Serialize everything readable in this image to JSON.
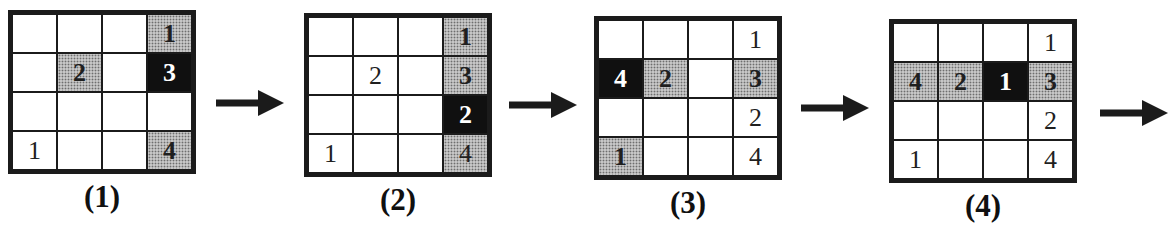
{
  "grids": [
    {
      "label": "(1)",
      "rows": [
        [
          {
            "v": "",
            "s": "empty"
          },
          {
            "v": "",
            "s": "empty"
          },
          {
            "v": "",
            "s": "empty"
          },
          {
            "v": "1",
            "s": "shaded"
          }
        ],
        [
          {
            "v": "",
            "s": "empty"
          },
          {
            "v": "2",
            "s": "shaded"
          },
          {
            "v": "",
            "s": "empty"
          },
          {
            "v": "3",
            "s": "solid"
          }
        ],
        [
          {
            "v": "",
            "s": "empty"
          },
          {
            "v": "",
            "s": "empty"
          },
          {
            "v": "",
            "s": "empty"
          },
          {
            "v": "",
            "s": "empty"
          }
        ],
        [
          {
            "v": "1",
            "s": "plain"
          },
          {
            "v": "",
            "s": "empty"
          },
          {
            "v": "",
            "s": "empty"
          },
          {
            "v": "4",
            "s": "shaded"
          }
        ]
      ]
    },
    {
      "label": "(2)",
      "rows": [
        [
          {
            "v": "",
            "s": "empty"
          },
          {
            "v": "",
            "s": "empty"
          },
          {
            "v": "",
            "s": "empty"
          },
          {
            "v": "1",
            "s": "shaded"
          }
        ],
        [
          {
            "v": "",
            "s": "empty"
          },
          {
            "v": "2",
            "s": "plain"
          },
          {
            "v": "",
            "s": "empty"
          },
          {
            "v": "3",
            "s": "shaded"
          }
        ],
        [
          {
            "v": "",
            "s": "empty"
          },
          {
            "v": "",
            "s": "empty"
          },
          {
            "v": "",
            "s": "empty"
          },
          {
            "v": "2",
            "s": "solid"
          }
        ],
        [
          {
            "v": "1",
            "s": "plain"
          },
          {
            "v": "",
            "s": "empty"
          },
          {
            "v": "",
            "s": "empty"
          },
          {
            "v": "4",
            "s": "shaded-plain"
          }
        ]
      ]
    },
    {
      "label": "(3)",
      "rows": [
        [
          {
            "v": "",
            "s": "empty"
          },
          {
            "v": "",
            "s": "empty"
          },
          {
            "v": "",
            "s": "empty"
          },
          {
            "v": "1",
            "s": "plain"
          }
        ],
        [
          {
            "v": "4",
            "s": "solid"
          },
          {
            "v": "2",
            "s": "shaded"
          },
          {
            "v": "",
            "s": "empty"
          },
          {
            "v": "3",
            "s": "shaded"
          }
        ],
        [
          {
            "v": "",
            "s": "empty"
          },
          {
            "v": "",
            "s": "empty"
          },
          {
            "v": "",
            "s": "empty"
          },
          {
            "v": "2",
            "s": "plain"
          }
        ],
        [
          {
            "v": "1",
            "s": "shaded"
          },
          {
            "v": "",
            "s": "empty"
          },
          {
            "v": "",
            "s": "empty"
          },
          {
            "v": "4",
            "s": "plain"
          }
        ]
      ]
    },
    {
      "label": "(4)",
      "rows": [
        [
          {
            "v": "",
            "s": "empty"
          },
          {
            "v": "",
            "s": "empty"
          },
          {
            "v": "",
            "s": "empty"
          },
          {
            "v": "1",
            "s": "plain"
          }
        ],
        [
          {
            "v": "4",
            "s": "shaded"
          },
          {
            "v": "2",
            "s": "shaded"
          },
          {
            "v": "1",
            "s": "solid"
          },
          {
            "v": "3",
            "s": "shaded"
          }
        ],
        [
          {
            "v": "",
            "s": "empty"
          },
          {
            "v": "",
            "s": "empty"
          },
          {
            "v": "",
            "s": "empty"
          },
          {
            "v": "2",
            "s": "plain"
          }
        ],
        [
          {
            "v": "1",
            "s": "plain"
          },
          {
            "v": "",
            "s": "empty"
          },
          {
            "v": "",
            "s": "empty"
          },
          {
            "v": "4",
            "s": "plain"
          }
        ]
      ]
    }
  ],
  "colors": {
    "grid_line": "#1b1b1b",
    "shaded_bg": "#c6c6c6",
    "shaded_dot": "#6e6e6e",
    "solid_bg": "#101010",
    "solid_text": "#ffffff",
    "text": "#1f1f1f",
    "arrow": "#1b1b1b"
  },
  "arrows": [
    "right-arrow",
    "right-arrow",
    "right-arrow",
    "right-arrow"
  ]
}
